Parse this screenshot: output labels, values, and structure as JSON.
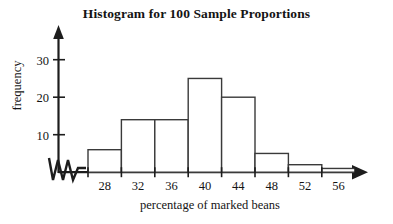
{
  "chart_data": {
    "type": "bar",
    "title": "Histogram for 100 Sample Proportions",
    "xlabel": "percentage of marked beans",
    "ylabel": "frequency",
    "categories": [
      "28",
      "32",
      "36",
      "40",
      "44",
      "48",
      "52",
      "56"
    ],
    "values": [
      6,
      14,
      14,
      25,
      20,
      5,
      2,
      1
    ],
    "bin_edges": [
      26,
      30,
      34,
      38,
      42,
      46,
      50,
      54,
      58
    ],
    "bin_width": 4,
    "x_tick_labels": [
      "28",
      "32",
      "36",
      "40",
      "44",
      "48",
      "52",
      "56"
    ],
    "y_tick_labels": [
      "10",
      "20",
      "30"
    ],
    "y_ticks": [
      10,
      20,
      30
    ],
    "ylim": [
      0,
      34
    ],
    "xlim": [
      26,
      58
    ],
    "grid": false,
    "legend": false,
    "x_axis_break": true,
    "bar_fill_color": "#ffffff",
    "bar_edge_color": "#3a3a3a",
    "axis_color": "#1d1d1d",
    "text_color": "#141414",
    "background_color": "#ffffff"
  },
  "axes": {
    "x_arrow": "arrow-right",
    "y_arrow": "arrow-up",
    "break_symbol": "zigzag"
  }
}
